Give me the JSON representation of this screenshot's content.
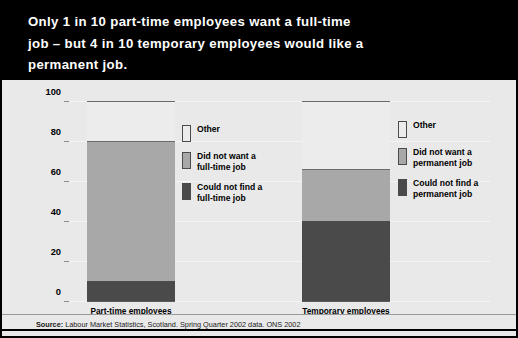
{
  "title": {
    "text": "Only 1 in 10 part-time employees want a full-time\njob – but 4 in 10 temporary employees would like a\npermanent job."
  },
  "axis": {
    "ylabel": "Percentage giving specified reason\nfor temporary/part-time employment",
    "ticks": [
      "0",
      "20",
      "40",
      "60",
      "80",
      "100"
    ]
  },
  "legends": [
    {
      "name": "part-time-legend",
      "items": [
        {
          "label": "Other",
          "color": "#ececec"
        },
        {
          "label": "Did not want a\nfull-time job",
          "color": "#a8a8a8"
        },
        {
          "label": "Could not find a\nfull-time job",
          "color": "#4a4a4a"
        }
      ]
    },
    {
      "name": "temporary-legend",
      "items": [
        {
          "label": "Other",
          "color": "#ececec"
        },
        {
          "label": "Did not want a\npermanent job",
          "color": "#a8a8a8"
        },
        {
          "label": "Could not find a\npermanent job",
          "color": "#4a4a4a"
        }
      ]
    }
  ],
  "footer": {
    "source_label": "Source:",
    "source_text": " Labour Market Statistics, Scotland. Spring Quarter 2002 data. ONS 2002"
  },
  "chart_data": {
    "type": "bar",
    "subtype": "stacked-bar",
    "title": "Only 1 in 10 part-time employees want a full-time job – but 4 in 10 temporary employees would like a permanent job.",
    "xlabel": "",
    "ylabel": "Percentage giving specified reason for temporary/part-time employment",
    "ylim": [
      0,
      100
    ],
    "yticks": [
      0,
      20,
      40,
      60,
      80,
      100
    ],
    "grid": true,
    "legend_position": "right-of-each-bar",
    "categories": [
      "Part-time employees",
      "Temporary employees"
    ],
    "series": [
      {
        "name": "Could not find a full-time/permanent job",
        "color": "#4a4a4a",
        "values": [
          10,
          40
        ]
      },
      {
        "name": "Did not want a full-time/permanent job",
        "color": "#a8a8a8",
        "values": [
          70,
          26
        ]
      },
      {
        "name": "Other",
        "color": "#ececec",
        "values": [
          20,
          34
        ]
      }
    ],
    "cumulative_tops": {
      "Part-time employees": {
        "could_not_find": 10,
        "did_not_want": 80,
        "other": 100
      },
      "Temporary employees": {
        "could_not_find": 40,
        "did_not_want": 66,
        "other": 100
      }
    }
  }
}
